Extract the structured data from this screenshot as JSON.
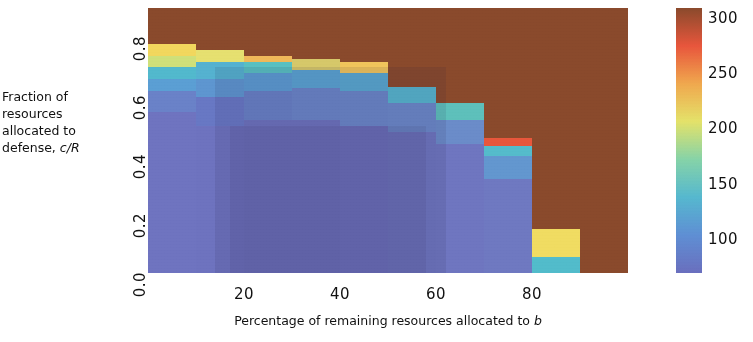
{
  "chart_data": {
    "type": "heatmap",
    "title": "",
    "xlabel": "Percentage of remaining resources allocated to b",
    "ylabel": "Fraction of resources allocated to defense, c/R",
    "xlabel_parts": {
      "pre": "Percentage of remaining resources allocated to ",
      "italic": "b"
    },
    "ylabel_lines": [
      "Fraction of",
      "resources",
      "allocated to",
      "defense, "
    ],
    "ylabel_italic": "c/R",
    "xlim": [
      0,
      100
    ],
    "ylim": [
      0.0,
      0.9
    ],
    "xticks": [
      "20",
      "40",
      "60",
      "80"
    ],
    "xtick_values": [
      20,
      40,
      60,
      80
    ],
    "yticks": [
      "0.0",
      "0.2",
      "0.4",
      "0.6",
      "0.8"
    ],
    "ytick_values": [
      0.0,
      0.2,
      0.4,
      0.6,
      0.8
    ],
    "grid": false,
    "legend": "none",
    "colorbar": {
      "position": "right",
      "ticks": [
        "100",
        "150",
        "200",
        "250",
        "300"
      ],
      "tick_values": [
        100,
        150,
        200,
        250,
        300
      ],
      "vmin": 70,
      "vmax": 310,
      "colors": [
        "#6a6fbe",
        "#5f8fd4",
        "#56b8cf",
        "#86d3a8",
        "#e4e26a",
        "#f0a84e",
        "#e8563c",
        "#8a4a2c"
      ]
    },
    "background_value": 300,
    "background_color": "#8a4a2c",
    "x_bin_edges": [
      0,
      10,
      20,
      30,
      40,
      50,
      60,
      70,
      80,
      90,
      100
    ],
    "y_bin_edges": [
      0.0,
      0.1,
      0.2,
      0.3,
      0.4,
      0.5,
      0.6,
      0.65,
      0.7,
      0.75,
      0.8,
      0.9
    ],
    "columns": [
      {
        "x_range": [
          0,
          10
        ],
        "top_y": 0.78,
        "bands": [
          {
            "y": [
              0.0,
              0.55
            ],
            "value": 95,
            "color": "#6f74c0"
          },
          {
            "y": [
              0.55,
              0.62
            ],
            "value": 110,
            "color": "#6a82c8"
          },
          {
            "y": [
              0.62,
              0.66
            ],
            "value": 140,
            "color": "#5b9fd4"
          },
          {
            "y": [
              0.66,
              0.7
            ],
            "value": 165,
            "color": "#52b9cd"
          },
          {
            "y": [
              0.7,
              0.74
            ],
            "value": 200,
            "color": "#cfe07a"
          },
          {
            "y": [
              0.74,
              0.78
            ],
            "value": 215,
            "color": "#f2d75e"
          },
          {
            "y": [
              0.78,
              0.9
            ],
            "value": 300,
            "color": "#8a4a2c"
          }
        ]
      },
      {
        "x_range": [
          10,
          20
        ],
        "top_y": 0.76,
        "bands": [
          {
            "y": [
              0.0,
              0.5
            ],
            "value": 92,
            "color": "#6e73bf"
          },
          {
            "y": [
              0.5,
              0.6
            ],
            "value": 100,
            "color": "#6878c4"
          },
          {
            "y": [
              0.6,
              0.66
            ],
            "value": 130,
            "color": "#5e96d0"
          },
          {
            "y": [
              0.66,
              0.72
            ],
            "value": 155,
            "color": "#55b2d0"
          },
          {
            "y": [
              0.72,
              0.76
            ],
            "value": 205,
            "color": "#e6e070"
          },
          {
            "y": [
              0.76,
              0.9
            ],
            "value": 300,
            "color": "#8a4a2c"
          }
        ]
      },
      {
        "x_range": [
          20,
          30
        ],
        "top_y": 0.74,
        "bands": [
          {
            "y": [
              0.0,
              0.52
            ],
            "value": 90,
            "color": "#6d72bd"
          },
          {
            "y": [
              0.52,
              0.62
            ],
            "value": 105,
            "color": "#6880c6"
          },
          {
            "y": [
              0.62,
              0.68
            ],
            "value": 135,
            "color": "#5c9bd2"
          },
          {
            "y": [
              0.68,
              0.72
            ],
            "value": 170,
            "color": "#59c0c2"
          },
          {
            "y": [
              0.72,
              0.74
            ],
            "value": 215,
            "color": "#f0b95a"
          },
          {
            "y": [
              0.74,
              0.9
            ],
            "value": 300,
            "color": "#8a4a2c"
          }
        ]
      },
      {
        "x_range": [
          30,
          40
        ],
        "top_y": 0.73,
        "bands": [
          {
            "y": [
              0.0,
              0.52
            ],
            "value": 90,
            "color": "#6d72bd"
          },
          {
            "y": [
              0.52,
              0.63
            ],
            "value": 108,
            "color": "#6a85c8"
          },
          {
            "y": [
              0.63,
              0.69
            ],
            "value": 145,
            "color": "#5aa3d2"
          },
          {
            "y": [
              0.69,
              0.73
            ],
            "value": 200,
            "color": "#d6c86a"
          },
          {
            "y": [
              0.73,
              0.9
            ],
            "value": 300,
            "color": "#8a4a2c"
          }
        ]
      },
      {
        "x_range": [
          40,
          50
        ],
        "top_y": 0.72,
        "bands": [
          {
            "y": [
              0.0,
              0.5
            ],
            "value": 92,
            "color": "#6e73bf"
          },
          {
            "y": [
              0.5,
              0.62
            ],
            "value": 110,
            "color": "#6a86c8"
          },
          {
            "y": [
              0.62,
              0.68
            ],
            "value": 150,
            "color": "#59a8d0"
          },
          {
            "y": [
              0.68,
              0.72
            ],
            "value": 215,
            "color": "#f0c45c"
          },
          {
            "y": [
              0.72,
              0.9
            ],
            "value": 300,
            "color": "#8a4a2c"
          }
        ]
      },
      {
        "x_range": [
          50,
          60
        ],
        "top_y": 0.635,
        "bands": [
          {
            "y": [
              0.0,
              0.48
            ],
            "value": 93,
            "color": "#6e75bf"
          },
          {
            "y": [
              0.48,
              0.58
            ],
            "value": 115,
            "color": "#6b88c9"
          },
          {
            "y": [
              0.58,
              0.635
            ],
            "value": 160,
            "color": "#56b5cd"
          },
          {
            "y": [
              0.635,
              0.9
            ],
            "value": 300,
            "color": "#8a4a2c"
          }
        ]
      },
      {
        "x_range": [
          60,
          70
        ],
        "top_y": 0.58,
        "bands": [
          {
            "y": [
              0.0,
              0.44
            ],
            "value": 95,
            "color": "#6f76c0"
          },
          {
            "y": [
              0.44,
              0.52
            ],
            "value": 120,
            "color": "#6b8cc9"
          },
          {
            "y": [
              0.52,
              0.58
            ],
            "value": 170,
            "color": "#5ec0bb"
          },
          {
            "y": [
              0.58,
              0.9
            ],
            "value": 300,
            "color": "#8a4a2c"
          }
        ]
      },
      {
        "x_range": [
          70,
          80
        ],
        "top_y": 0.46,
        "bands": [
          {
            "y": [
              0.0,
              0.32
            ],
            "value": 100,
            "color": "#6f79c1"
          },
          {
            "y": [
              0.32,
              0.4
            ],
            "value": 135,
            "color": "#6397cf"
          },
          {
            "y": [
              0.4,
              0.435
            ],
            "value": 175,
            "color": "#55bccb"
          },
          {
            "y": [
              0.435,
              0.46
            ],
            "value": 255,
            "color": "#e8573c"
          },
          {
            "y": [
              0.46,
              0.9
            ],
            "value": 300,
            "color": "#8a4a2c"
          }
        ]
      },
      {
        "x_range": [
          80,
          90
        ],
        "top_y": 0.15,
        "bands": [
          {
            "y": [
              0.0,
              0.055
            ],
            "value": 165,
            "color": "#52bccb"
          },
          {
            "y": [
              0.055,
              0.15
            ],
            "value": 210,
            "color": "#f0dc62"
          },
          {
            "y": [
              0.15,
              0.9
            ],
            "value": 300,
            "color": "#8a4a2c"
          }
        ]
      },
      {
        "x_range": [
          90,
          100
        ],
        "top_y": 0.0,
        "bands": [
          {
            "y": [
              0.0,
              0.9
            ],
            "value": 300,
            "color": "#8a4a2c"
          }
        ]
      }
    ]
  }
}
